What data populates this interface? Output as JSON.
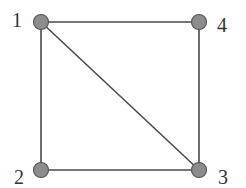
{
  "graph": {
    "nodes": [
      {
        "id": "1",
        "label": "1",
        "x": 41,
        "y": 22,
        "lx": 12,
        "ly": 27
      },
      {
        "id": "2",
        "label": "2",
        "x": 41,
        "y": 170,
        "lx": 14,
        "ly": 184
      },
      {
        "id": "3",
        "label": "3",
        "x": 199,
        "y": 170,
        "lx": 218,
        "ly": 184
      },
      {
        "id": "4",
        "label": "4",
        "x": 199,
        "y": 22,
        "lx": 217,
        "ly": 32
      }
    ],
    "edges": [
      {
        "from": "1",
        "to": "4"
      },
      {
        "from": "1",
        "to": "2"
      },
      {
        "from": "1",
        "to": "3"
      },
      {
        "from": "2",
        "to": "3"
      },
      {
        "from": "4",
        "to": "3"
      }
    ],
    "colors": {
      "node_fill": "#8c8c8c",
      "edge": "#4a4a4a",
      "label": "#333333"
    }
  }
}
